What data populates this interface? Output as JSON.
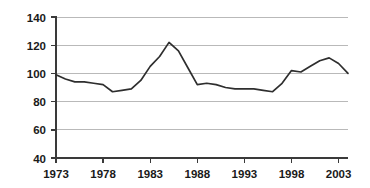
{
  "chart_data": {
    "type": "line",
    "title": "",
    "subtitle": "",
    "xlabel": "",
    "ylabel": "",
    "xlim": [
      1973,
      2004
    ],
    "ylim": [
      40,
      140
    ],
    "grid": true,
    "legend": "none",
    "y_ticks": [
      40,
      60,
      80,
      100,
      120,
      140
    ],
    "x_ticks": [
      1973,
      1978,
      1983,
      1988,
      1993,
      1998,
      2003
    ],
    "x_tick_labels": [
      "1973",
      "1978",
      "1983",
      "1988",
      "1993",
      "1998",
      "2003"
    ],
    "y_tick_labels": [
      "40",
      "60",
      "80",
      "100",
      "120",
      "140"
    ],
    "series": [
      {
        "name": "index",
        "color": "#2e2e2e",
        "x": [
          1973,
          1974,
          1975,
          1976,
          1977,
          1978,
          1979,
          1980,
          1981,
          1982,
          1983,
          1984,
          1985,
          1986,
          1987,
          1988,
          1989,
          1990,
          1991,
          1992,
          1993,
          1994,
          1995,
          1996,
          1997,
          1998,
          1999,
          2000,
          2001,
          2002,
          2003,
          2004
        ],
        "values": [
          99,
          96,
          94,
          94,
          93,
          92,
          87,
          88,
          89,
          95,
          105,
          112,
          122,
          116,
          104,
          92,
          93,
          92,
          90,
          89,
          89,
          89,
          88,
          87,
          93,
          102,
          101,
          105,
          109,
          111,
          107,
          100
        ]
      }
    ]
  },
  "colors": {
    "line": "#2e2e2e",
    "gridline": "#b9b9b9",
    "axis": "#3a3a3a",
    "text": "#1a1a1a",
    "background": "#ffffff"
  }
}
